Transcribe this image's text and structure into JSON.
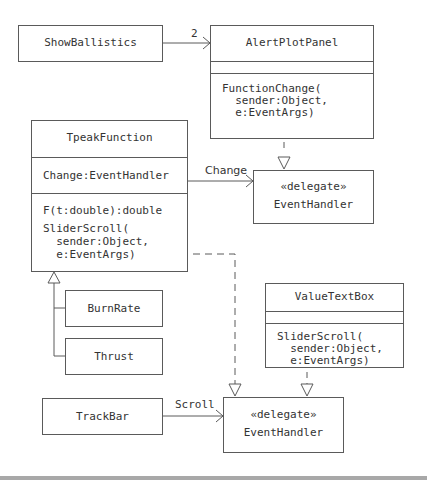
{
  "diagram": {
    "type": "UML class diagram",
    "classes": {
      "show_ballistics": {
        "name": "ShowBallistics"
      },
      "alert_plot_panel": {
        "name": "AlertPlotPanel",
        "attributes": [],
        "operations": [
          "FunctionChange(",
          "  sender:Object,",
          "  e:EventArgs)"
        ]
      },
      "tpeak_function": {
        "name": "TpeakFunction",
        "attributes": [
          "Change:EventHandler"
        ],
        "operations": [
          "F(t:double):double",
          "SliderScroll(",
          "  sender:Object,",
          "  e:EventArgs)"
        ]
      },
      "event_handler_top": {
        "stereotype": "«delegate»",
        "name": "EventHandler"
      },
      "value_text_box": {
        "name": "ValueTextBox",
        "attributes": [],
        "operations": [
          "SliderScroll(",
          "  sender:Object,",
          "  e:EventArgs)"
        ]
      },
      "burn_rate": {
        "name": "BurnRate"
      },
      "thrust": {
        "name": "Thrust"
      },
      "track_bar": {
        "name": "TrackBar"
      },
      "event_handler_bottom": {
        "stereotype": "«delegate»",
        "name": "EventHandler"
      }
    },
    "relationships": [
      {
        "from": "ShowBallistics",
        "to": "AlertPlotPanel",
        "kind": "association",
        "label": "2"
      },
      {
        "from": "AlertPlotPanel.FunctionChange",
        "to": "EventHandler (top)",
        "kind": "realization",
        "label": ""
      },
      {
        "from": "TpeakFunction",
        "to": "EventHandler (top)",
        "kind": "association",
        "label": "Change"
      },
      {
        "from": "TpeakFunction.SliderScroll",
        "to": "EventHandler (bottom)",
        "kind": "realization",
        "label": ""
      },
      {
        "from": "BurnRate",
        "to": "TpeakFunction",
        "kind": "generalization",
        "label": ""
      },
      {
        "from": "Thrust",
        "to": "TpeakFunction",
        "kind": "generalization",
        "label": ""
      },
      {
        "from": "ValueTextBox.SliderScroll",
        "to": "EventHandler (bottom)",
        "kind": "realization",
        "label": ""
      },
      {
        "from": "TrackBar",
        "to": "EventHandler (bottom)",
        "kind": "association",
        "label": "Scroll"
      }
    ],
    "labels": {
      "multiplicity_2": "2",
      "change": "Change",
      "scroll": "Scroll"
    },
    "colors": {
      "line": "#5a5a5a",
      "text": "#333333",
      "background": "#ffffff",
      "bottom_bar": "#a8a8a8"
    }
  }
}
